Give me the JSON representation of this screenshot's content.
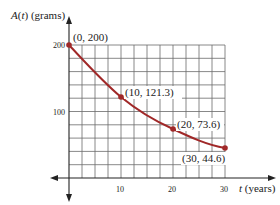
{
  "chart_data": {
    "type": "line",
    "title": "",
    "xlabel": "t (years)",
    "ylabel": "A(t) (grams)",
    "xlim": [
      0,
      30
    ],
    "ylim": [
      0,
      200
    ],
    "x_ticks": [
      "10",
      "20",
      "30"
    ],
    "y_ticks": [
      "100",
      "200"
    ],
    "grid": true,
    "series": [
      {
        "name": "A(t)",
        "x": [
          0,
          10,
          20,
          30
        ],
        "values": [
          200,
          121.3,
          73.6,
          44.6
        ],
        "color": "#a02828"
      }
    ],
    "annotations": [
      "(0, 200)",
      "(10, 121.3)",
      "(20, 73.6)",
      "(30, 44.6)"
    ]
  },
  "labels": {
    "ylabel_prefix": "A",
    "ylabel_var": "t",
    "ylabel_suffix": "(grams)",
    "xlabel_var": "t",
    "xlabel_suffix": "(years)",
    "tick_x10": "10",
    "tick_x20": "20",
    "tick_x30": "30",
    "tick_y100": "100",
    "tick_y200": "200",
    "pt0": "(0, 200)",
    "pt1": "(10, 121.3)",
    "pt2": "(20, 73.6)",
    "pt3": "(30, 44.6)"
  },
  "colors": {
    "curve": "#a02828",
    "grid": "#555555",
    "axis": "#222222"
  }
}
